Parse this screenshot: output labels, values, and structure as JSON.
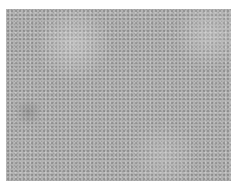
{
  "image": {
    "description": "Phase-contrast micrograph of a confluent monolayer of cobblestone-shaped cells",
    "base_color": "#b3b3b3",
    "border_color": "#ffffff"
  }
}
